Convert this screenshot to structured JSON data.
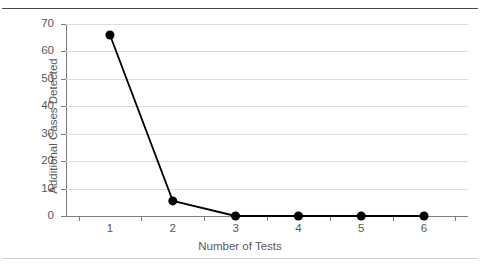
{
  "figure": {
    "background_color": "#ffffff",
    "top_rule_color": "#4a4a4a",
    "bottom_rule_color": "#cfcfcf",
    "axis_color": "#7d7d7d",
    "grid_color": "#dcdcdc",
    "text_color": "#58595b",
    "series_color": "#000000"
  },
  "chart_data": {
    "type": "line",
    "title": "",
    "xlabel": "Number of Tests",
    "ylabel": "Additional Cases Detected",
    "categories": [
      "1",
      "2",
      "3",
      "4",
      "5",
      "6"
    ],
    "x": [
      1,
      2,
      3,
      4,
      5,
      6
    ],
    "values": [
      66,
      5.5,
      0,
      0,
      0,
      0
    ],
    "series": [
      {
        "name": "Additional Cases Detected",
        "values": [
          66,
          5.5,
          0,
          0,
          0,
          0
        ],
        "color": "#000000",
        "marker": "filled-circle",
        "marker_size": 9,
        "line_width": 1.8
      }
    ],
    "ylim": [
      0,
      70
    ],
    "yticks": [
      0,
      10,
      20,
      30,
      40,
      50,
      60,
      70
    ],
    "ytick_labels": [
      "0",
      "10",
      "20",
      "30",
      "40",
      "50",
      "60",
      "70"
    ],
    "xtick_labels": [
      "1",
      "2",
      "3",
      "4",
      "5",
      "6"
    ],
    "grid": "horizontal",
    "legend": "none",
    "annotations": []
  }
}
